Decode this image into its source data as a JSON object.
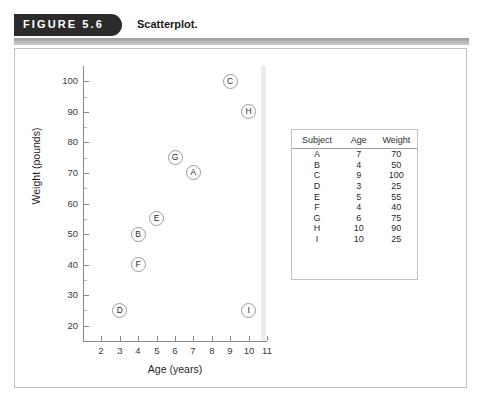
{
  "figure": {
    "tab_label": "FIGURE 5.6",
    "caption": "Scatterplot."
  },
  "chart_data": {
    "type": "scatter",
    "title": "Scatterplot.",
    "xlabel": "Age (years)",
    "ylabel": "Weight (pounds)",
    "xlim": [
      1,
      11
    ],
    "ylim": [
      15,
      105
    ],
    "xticks": [
      2,
      3,
      4,
      5,
      6,
      7,
      8,
      9,
      10,
      11
    ],
    "yticks": [
      20,
      30,
      40,
      50,
      60,
      70,
      80,
      90,
      100
    ],
    "grid": false,
    "legend": "none",
    "point_labels": [
      "A",
      "B",
      "C",
      "D",
      "E",
      "F",
      "G",
      "H",
      "I"
    ],
    "x": [
      7,
      4,
      9,
      3,
      5,
      4,
      6,
      10,
      10
    ],
    "y": [
      70,
      50,
      100,
      25,
      55,
      40,
      75,
      90,
      25
    ],
    "points": [
      {
        "label": "A",
        "age": 7,
        "weight": 70
      },
      {
        "label": "B",
        "age": 4,
        "weight": 50
      },
      {
        "label": "C",
        "age": 9,
        "weight": 100
      },
      {
        "label": "D",
        "age": 3,
        "weight": 25
      },
      {
        "label": "E",
        "age": 5,
        "weight": 55
      },
      {
        "label": "F",
        "age": 4,
        "weight": 40
      },
      {
        "label": "G",
        "age": 6,
        "weight": 75
      },
      {
        "label": "H",
        "age": 10,
        "weight": 90
      },
      {
        "label": "I",
        "age": 10,
        "weight": 25
      }
    ]
  },
  "table": {
    "columns": [
      "Subject",
      "Age",
      "Weight"
    ],
    "rows": [
      [
        "A",
        "7",
        "70"
      ],
      [
        "B",
        "4",
        "50"
      ],
      [
        "C",
        "9",
        "100"
      ],
      [
        "D",
        "3",
        "25"
      ],
      [
        "E",
        "5",
        "55"
      ],
      [
        "F",
        "4",
        "40"
      ],
      [
        "G",
        "6",
        "75"
      ],
      [
        "H",
        "10",
        "90"
      ],
      [
        "I",
        "10",
        "25"
      ]
    ]
  },
  "colors": {
    "tab_background": "#2b2b2b",
    "tab_text": "#ffffff",
    "axis": "#8a8a8a",
    "point_outline": "#9b9b9b",
    "border": "#bfbfbf"
  }
}
